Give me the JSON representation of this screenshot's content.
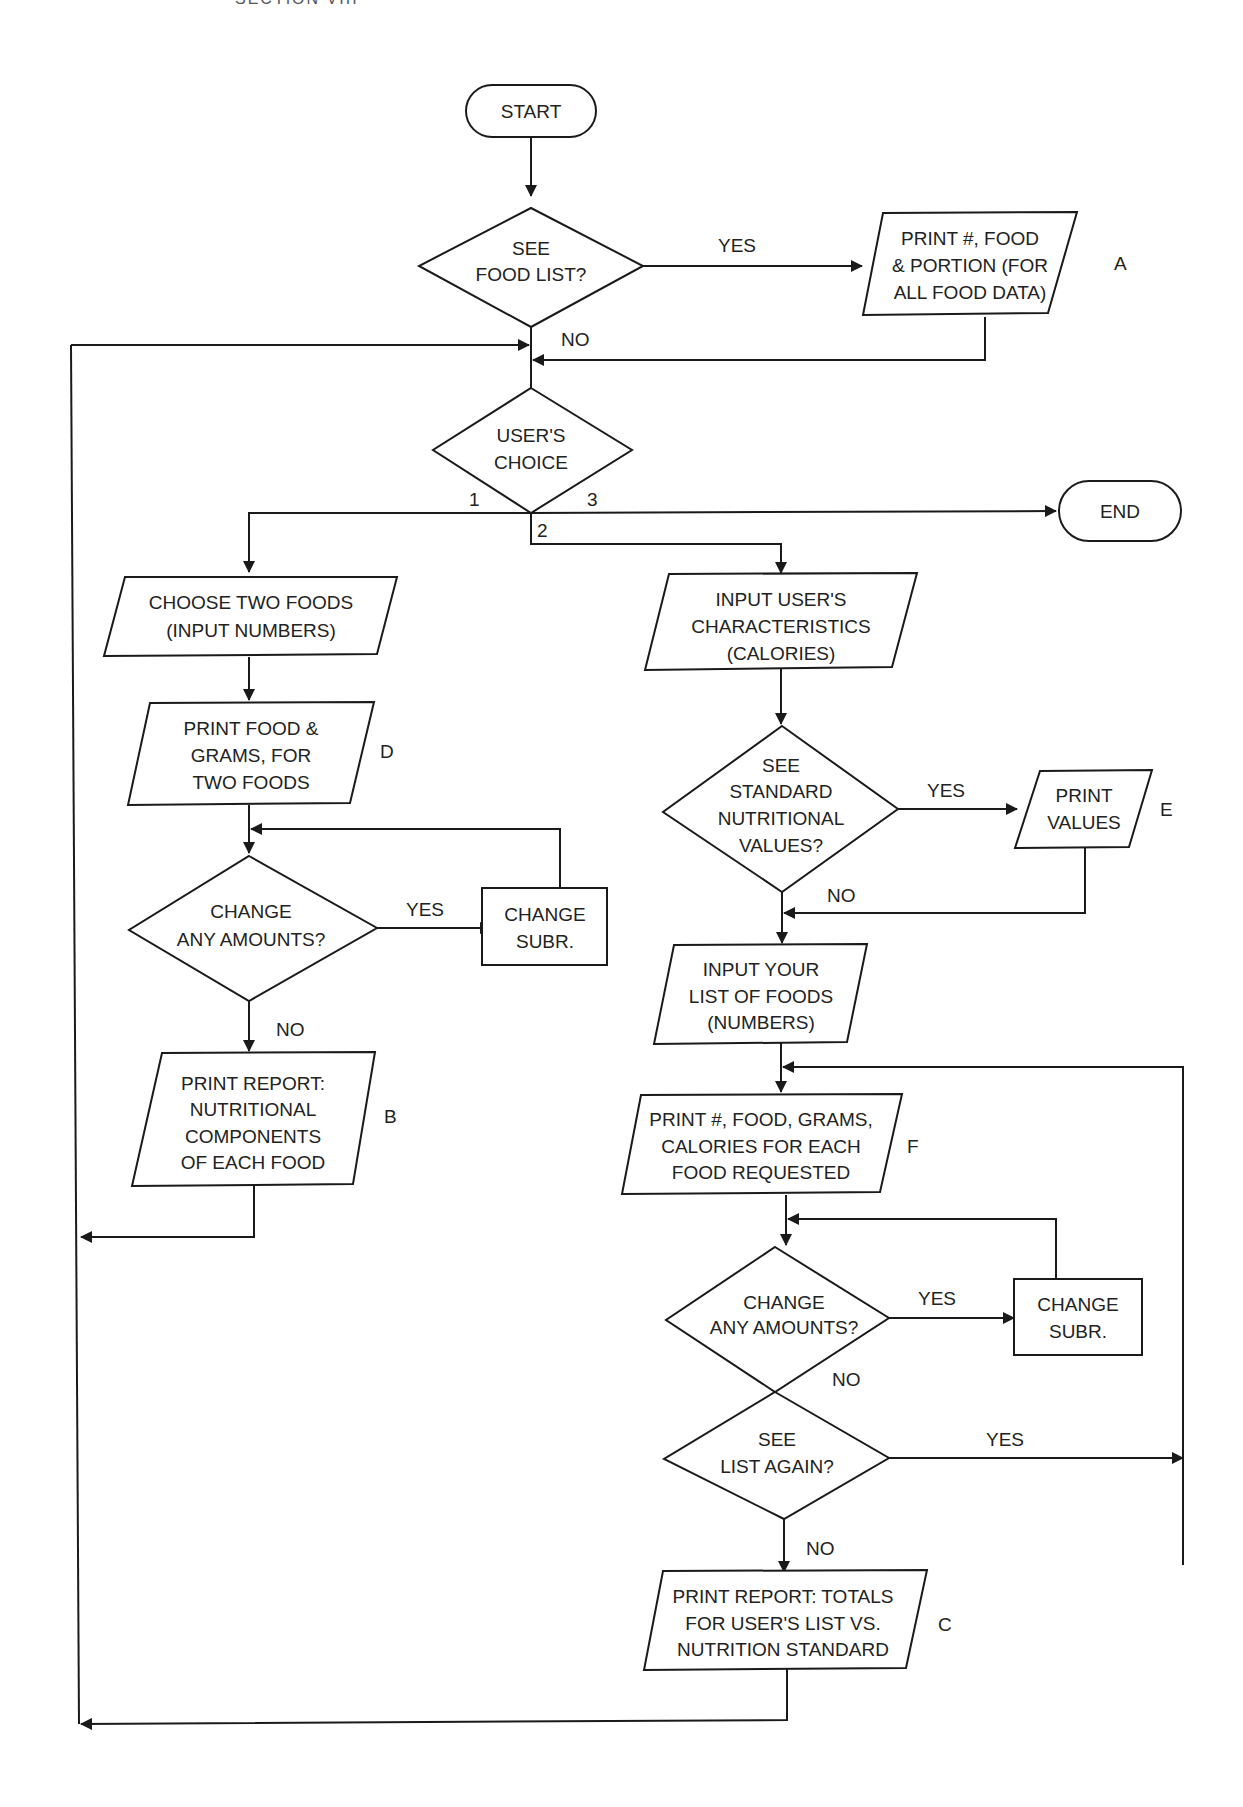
{
  "header": {
    "text": "SECTION VIII"
  },
  "nodes": {
    "start": {
      "label": "START"
    },
    "see_food_list": {
      "lines": [
        "SEE",
        "FOOD LIST?"
      ]
    },
    "print_all_food": {
      "lines": [
        "PRINT #, FOOD",
        "& PORTION (FOR",
        "ALL FOOD DATA)"
      ],
      "tag": "A"
    },
    "users_choice": {
      "lines": [
        "USER'S",
        "CHOICE"
      ]
    },
    "end": {
      "label": "END"
    },
    "choose_two_foods": {
      "lines": [
        "CHOOSE TWO FOODS",
        "(INPUT NUMBERS)"
      ]
    },
    "print_food_grams": {
      "lines": [
        "PRINT FOOD &",
        "GRAMS, FOR",
        "TWO FOODS"
      ],
      "tag": "D"
    },
    "change_amounts_1": {
      "lines": [
        "CHANGE",
        "ANY AMOUNTS?"
      ]
    },
    "change_subr_1": {
      "lines": [
        "CHANGE",
        "SUBR."
      ]
    },
    "print_report_b": {
      "lines": [
        "PRINT REPORT:",
        "NUTRITIONAL",
        "COMPONENTS",
        "OF EACH FOOD"
      ],
      "tag": "B"
    },
    "input_user_chars": {
      "lines": [
        "INPUT USER'S",
        "CHARACTERISTICS",
        "(CALORIES)"
      ]
    },
    "see_standard": {
      "lines": [
        "SEE",
        "STANDARD",
        "NUTRITIONAL",
        "VALUES?"
      ]
    },
    "print_values": {
      "lines": [
        "PRINT",
        "VALUES"
      ],
      "tag": "E"
    },
    "input_food_list": {
      "lines": [
        "INPUT YOUR",
        "LIST OF FOODS",
        "(NUMBERS)"
      ]
    },
    "print_food_cal": {
      "lines": [
        "PRINT #, FOOD, GRAMS,",
        "CALORIES FOR EACH",
        "FOOD REQUESTED"
      ],
      "tag": "F"
    },
    "change_amounts_2": {
      "lines": [
        "CHANGE",
        "ANY AMOUNTS?"
      ]
    },
    "change_subr_2": {
      "lines": [
        "CHANGE",
        "SUBR."
      ]
    },
    "see_list_again": {
      "lines": [
        "SEE",
        "LIST AGAIN?"
      ]
    },
    "print_report_c": {
      "lines": [
        "PRINT REPORT: TOTALS",
        "FOR USER'S LIST VS.",
        "NUTRITION STANDARD"
      ],
      "tag": "C"
    }
  },
  "edges": {
    "food_list_yes": "YES",
    "food_list_no": "NO",
    "choice_1": "1",
    "choice_2": "2",
    "choice_3": "3",
    "amounts1_yes": "YES",
    "amounts1_no": "NO",
    "standard_yes": "YES",
    "standard_no": "NO",
    "amounts2_yes": "YES",
    "amounts2_no": "NO",
    "list_again_yes": "YES",
    "list_again_no": "NO"
  }
}
